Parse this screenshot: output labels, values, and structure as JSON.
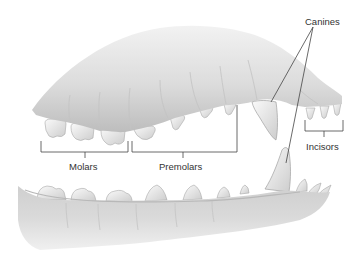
{
  "diagram": {
    "labels": {
      "canines": "Canines",
      "incisors": "Incisors",
      "molars": "Molars",
      "premolars": "Premolars"
    },
    "colors": {
      "background": "#ffffff",
      "gum_light": "#e6e6e6",
      "gum_dark": "#b4b4b4",
      "tooth": "#f4f4f4",
      "tooth_shade": "#c9c9c9",
      "leader_line": "#444444",
      "text": "#333333"
    }
  }
}
